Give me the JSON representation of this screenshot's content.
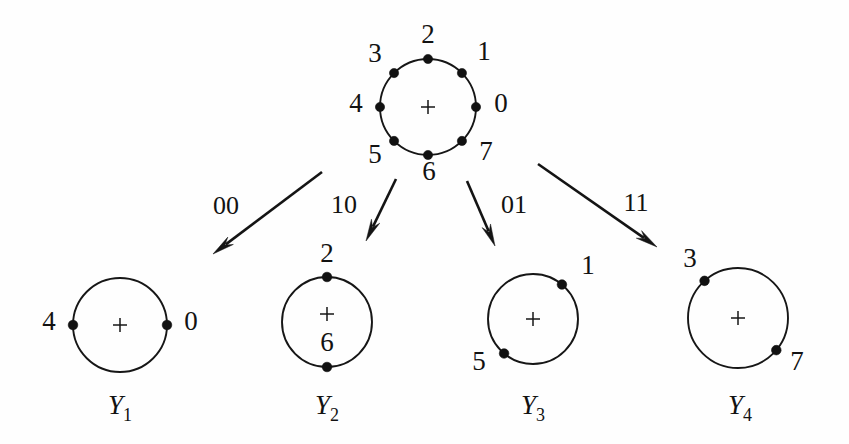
{
  "figure": {
    "background_color": "#fefefe",
    "ink_color": "#121212"
  },
  "parent_constellation": {
    "name": "8-PSK",
    "center": {
      "x": 428,
      "y": 107
    },
    "radius": 48,
    "center_marker": "+",
    "points": [
      {
        "label": "0",
        "angle_deg": 0,
        "label_x": 501,
        "label_y": 106
      },
      {
        "label": "1",
        "angle_deg": 45,
        "label_x": 484,
        "label_y": 54
      },
      {
        "label": "2",
        "angle_deg": 90,
        "label_x": 428,
        "label_y": 37
      },
      {
        "label": "3",
        "angle_deg": 135,
        "label_x": 375,
        "label_y": 56
      },
      {
        "label": "4",
        "angle_deg": 180,
        "label_x": 356,
        "label_y": 106
      },
      {
        "label": "5",
        "angle_deg": 225,
        "label_x": 375,
        "label_y": 157
      },
      {
        "label": "6",
        "angle_deg": 270,
        "label_x": 429,
        "label_y": 174
      },
      {
        "label": "7",
        "angle_deg": 315,
        "label_x": 486,
        "label_y": 154
      }
    ]
  },
  "branches": [
    {
      "label": "00",
      "target": "Y1",
      "label_x": 226,
      "label_y": 208,
      "x1": 322,
      "y1": 172,
      "x2": 213,
      "y2": 254
    },
    {
      "label": "10",
      "target": "Y2",
      "label_x": 344,
      "label_y": 207,
      "x1": 396,
      "y1": 179,
      "x2": 366,
      "y2": 241
    },
    {
      "label": "01",
      "target": "Y3",
      "label_x": 514,
      "label_y": 207,
      "x1": 467,
      "y1": 181,
      "x2": 495,
      "y2": 246
    },
    {
      "label": "11",
      "target": "Y4",
      "label_x": 636,
      "label_y": 205,
      "x1": 538,
      "y1": 164,
      "x2": 657,
      "y2": 247
    }
  ],
  "subsets": [
    {
      "name": "Y1",
      "base": "Y",
      "subscript": "1",
      "label_x": 120,
      "label_y": 414,
      "center": {
        "x": 120,
        "y": 325
      },
      "radius": 47,
      "center_marker": "+",
      "center_marker_dy": 0,
      "points": [
        {
          "label": "0",
          "angle_deg": 0,
          "label_x": 191,
          "label_y": 324
        },
        {
          "label": "4",
          "angle_deg": 180,
          "label_x": 49,
          "label_y": 324
        }
      ]
    },
    {
      "name": "Y2",
      "base": "Y",
      "subscript": "2",
      "label_x": 327,
      "label_y": 414,
      "center": {
        "x": 327,
        "y": 322
      },
      "radius": 45,
      "center_marker": "+",
      "center_marker_dy": -8,
      "points": [
        {
          "label": "2",
          "angle_deg": 90,
          "label_x": 327,
          "label_y": 256
        },
        {
          "label": "6",
          "angle_deg": 270,
          "label_x": 327,
          "label_y": 345
        }
      ]
    },
    {
      "name": "Y3",
      "base": "Y",
      "subscript": "3",
      "label_x": 533,
      "label_y": 414,
      "center": {
        "x": 533,
        "y": 319
      },
      "radius": 45,
      "center_marker": "+",
      "center_marker_dy": 0,
      "points": [
        {
          "label": "1",
          "angle_deg": 50,
          "label_x": 588,
          "label_y": 268
        },
        {
          "label": "5",
          "angle_deg": 230,
          "label_x": 479,
          "label_y": 364
        }
      ]
    },
    {
      "name": "Y4",
      "base": "Y",
      "subscript": "4",
      "label_x": 740,
      "label_y": 414,
      "center": {
        "x": 738,
        "y": 318
      },
      "radius": 50,
      "center_marker": "+",
      "center_marker_dy": 0,
      "points": [
        {
          "label": "3",
          "angle_deg": 132,
          "label_x": 690,
          "label_y": 261
        },
        {
          "label": "7",
          "angle_deg": -40,
          "label_x": 797,
          "label_y": 364
        }
      ]
    }
  ]
}
